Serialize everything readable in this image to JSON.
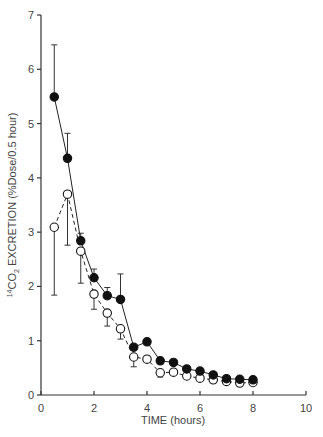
{
  "chart_data": {
    "type": "line",
    "title": "",
    "xlabel": "TIME (hours)",
    "ylabel_parts": {
      "sup": "14",
      "base": "CO",
      "sub": "2",
      "rest": " EXCRETION (%Dose/0.5 hour)"
    },
    "ylabel": "14CO2 EXCRETION (%Dose/0.5 hour)",
    "xlim": [
      0,
      10
    ],
    "ylim": [
      0,
      7
    ],
    "xticks": [
      0,
      2,
      4,
      6,
      8,
      10
    ],
    "yticks": [
      0,
      1,
      2,
      3,
      4,
      5,
      6,
      7
    ],
    "grid": false,
    "legend": "none",
    "x": [
      0.5,
      1,
      1.5,
      2,
      2.5,
      3,
      3.5,
      4,
      4.5,
      5,
      5.5,
      6,
      6.5,
      7,
      7.5,
      8
    ],
    "series": [
      {
        "name": "filled circles (solid line)",
        "marker": "filled-circle",
        "line": "solid",
        "values": [
          5.49,
          4.36,
          2.84,
          2.16,
          1.83,
          1.76,
          0.88,
          0.98,
          0.63,
          0.6,
          0.48,
          0.44,
          0.37,
          0.3,
          0.29,
          0.28
        ],
        "error_upper": [
          6.45,
          4.82,
          2.98,
          2.32,
          1.98,
          2.23,
          null,
          null,
          null,
          null,
          null,
          null,
          null,
          null,
          null,
          null
        ]
      },
      {
        "name": "open circles (dashed line)",
        "marker": "open-circle",
        "line": "dashed",
        "values": [
          3.09,
          3.7,
          2.65,
          1.86,
          1.51,
          1.22,
          0.7,
          0.66,
          0.41,
          0.42,
          0.35,
          0.31,
          0.28,
          0.25,
          0.22,
          0.23
        ],
        "error_lower": [
          1.84,
          2.76,
          2.06,
          1.58,
          1.27,
          1.03,
          0.52,
          null,
          0.33,
          null,
          null,
          null,
          null,
          null,
          null,
          null
        ]
      }
    ]
  }
}
